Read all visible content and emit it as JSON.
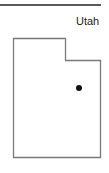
{
  "map": {
    "state_name": "Utah",
    "outline_color": "#7a7a7a",
    "marker_color": "#111111",
    "rule_color": "#5a5a5a",
    "outline_points": "13.5,38.5 65.5,38.5 65.5,60.5 100.5,60.5 100.5,157.5 13.5,157.5",
    "marker": {
      "cx": 79,
      "cy": 88,
      "r": 3
    }
  }
}
